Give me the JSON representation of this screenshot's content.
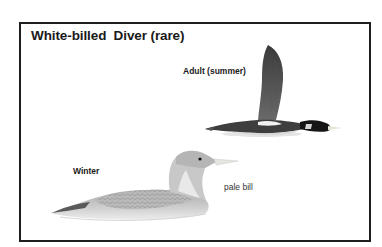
{
  "plate": {
    "title": "White-billed  Diver (rare)",
    "labels": {
      "adult": "Adult (summer)",
      "winter": "Winter",
      "bill_note": "pale bill"
    }
  },
  "illustrations": [
    {
      "name": "adult-summer-flying-diver",
      "description": "dark diver in flight, wings raised, white bill"
    },
    {
      "name": "winter-swimming-diver",
      "description": "pale grey diver swimming, scaled back, pale bill"
    }
  ],
  "colors": {
    "frame": "#1e1e1e",
    "text": "#1a1a1a",
    "background": "#ffffff"
  }
}
